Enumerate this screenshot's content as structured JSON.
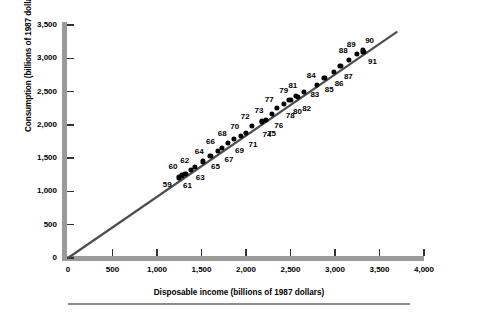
{
  "chart_data": {
    "type": "scatter",
    "title": "",
    "xlabel": "Disposable income (billions of 1987 dollars)",
    "ylabel": "Consumption (billions of 1987 dollars)",
    "xlim": [
      0,
      4000
    ],
    "ylim": [
      0,
      3500
    ],
    "xticks": [
      0,
      500,
      1000,
      1500,
      2000,
      2500,
      3000,
      3500,
      4000
    ],
    "xtick_labels": [
      "0",
      "500",
      "1,000",
      "1,500",
      "2,000",
      "2,500",
      "3,000",
      "3,500",
      "4,000"
    ],
    "yticks": [
      0,
      500,
      1000,
      1500,
      2000,
      2500,
      3000,
      3500
    ],
    "ytick_labels": [
      "0",
      "500",
      "1,000",
      "1,500",
      "2,000",
      "2,500",
      "3,000",
      "3,500"
    ],
    "grid": false,
    "legend": null,
    "point_color": "#000000",
    "line_color": "#4d4d4d",
    "axis_color": "#9a9a9a",
    "trendline": {
      "x0": 0,
      "y0": 0,
      "x1": 3700,
      "y1": 3400
    },
    "point_label_meaning": "year (last two digits)",
    "points": [
      {
        "label": "59",
        "x": 1250,
        "y": 1210,
        "lx": -12,
        "ly": 7
      },
      {
        "label": "60",
        "x": 1280,
        "y": 1240,
        "lx": -9,
        "ly": -9
      },
      {
        "label": "61",
        "x": 1320,
        "y": 1260,
        "lx": 2,
        "ly": 11
      },
      {
        "label": "62",
        "x": 1380,
        "y": 1320,
        "lx": -6,
        "ly": -10
      },
      {
        "label": "63",
        "x": 1430,
        "y": 1370,
        "lx": 5,
        "ly": 10
      },
      {
        "label": "64",
        "x": 1520,
        "y": 1450,
        "lx": -4,
        "ly": -10
      },
      {
        "label": "65",
        "x": 1600,
        "y": 1530,
        "lx": 5,
        "ly": 10
      },
      {
        "label": "66",
        "x": 1680,
        "y": 1610,
        "lx": -7,
        "ly": -10
      },
      {
        "label": "67",
        "x": 1730,
        "y": 1650,
        "lx": 7,
        "ly": 11
      },
      {
        "label": "68",
        "x": 1800,
        "y": 1730,
        "lx": -6,
        "ly": -10
      },
      {
        "label": "69",
        "x": 1860,
        "y": 1790,
        "lx": 6,
        "ly": 11
      },
      {
        "label": "70",
        "x": 1940,
        "y": 1830,
        "lx": -6,
        "ly": -10
      },
      {
        "label": "71",
        "x": 2000,
        "y": 1880,
        "lx": 7,
        "ly": 11
      },
      {
        "label": "72",
        "x": 2070,
        "y": 1990,
        "lx": -7,
        "ly": -10
      },
      {
        "label": "73",
        "x": 2180,
        "y": 2060,
        "lx": -3,
        "ly": -11
      },
      {
        "label": "74",
        "x": 2180,
        "y": 2040,
        "lx": 5,
        "ly": 12
      },
      {
        "label": "75",
        "x": 2220,
        "y": 2070,
        "lx": 6,
        "ly": 13
      },
      {
        "label": "76",
        "x": 2290,
        "y": 2170,
        "lx": 7,
        "ly": 11
      },
      {
        "label": "77",
        "x": 2350,
        "y": 2250,
        "lx": -8,
        "ly": -9
      },
      {
        "label": "78",
        "x": 2430,
        "y": 2320,
        "lx": 6,
        "ly": 11
      },
      {
        "label": "79",
        "x": 2480,
        "y": 2380,
        "lx": -5,
        "ly": -10
      },
      {
        "label": "80",
        "x": 2500,
        "y": 2380,
        "lx": 7,
        "ly": 11
      },
      {
        "label": "81",
        "x": 2560,
        "y": 2430,
        "lx": -3,
        "ly": -11
      },
      {
        "label": "82",
        "x": 2580,
        "y": 2420,
        "lx": 9,
        "ly": 11
      },
      {
        "label": "83",
        "x": 2650,
        "y": 2490,
        "lx": 11,
        "ly": 2
      },
      {
        "label": "84",
        "x": 2800,
        "y": 2600,
        "lx": -6,
        "ly": -10
      },
      {
        "label": "85",
        "x": 2880,
        "y": 2700,
        "lx": 5,
        "ly": 11
      },
      {
        "label": "86",
        "x": 2990,
        "y": 2800,
        "lx": 5,
        "ly": 11
      },
      {
        "label": "87",
        "x": 3060,
        "y": 2880,
        "lx": 8,
        "ly": 10
      },
      {
        "label": "88",
        "x": 3160,
        "y": 2970,
        "lx": -6,
        "ly": -10
      },
      {
        "label": "89",
        "x": 3250,
        "y": 3060,
        "lx": -6,
        "ly": -10
      },
      {
        "label": "90",
        "x": 3310,
        "y": 3120,
        "lx": 7,
        "ly": -10
      },
      {
        "label": "91",
        "x": 3320,
        "y": 3100,
        "lx": 9,
        "ly": 9
      }
    ]
  },
  "figure": {
    "footer_rule_visible": true
  }
}
